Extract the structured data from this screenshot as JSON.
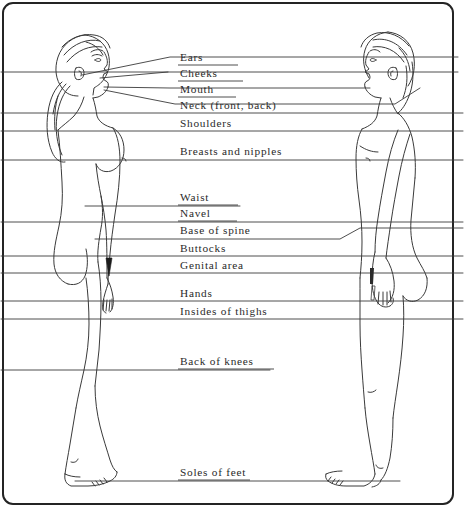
{
  "diagram": {
    "figures": [
      {
        "name": "female-side-profile",
        "side": "left",
        "facing": "right"
      },
      {
        "name": "male-side-profile",
        "side": "right",
        "facing": "left"
      }
    ],
    "labels": [
      {
        "id": "ears",
        "text": "Ears",
        "x": 180,
        "y": 60
      },
      {
        "id": "cheeks",
        "text": "Cheeks",
        "x": 180,
        "y": 76
      },
      {
        "id": "mouth",
        "text": "Mouth",
        "x": 180,
        "y": 92
      },
      {
        "id": "neck",
        "text": "Neck  (front,  back)",
        "x": 180,
        "y": 108
      },
      {
        "id": "shoulders",
        "text": "Shoulders",
        "x": 180,
        "y": 124
      },
      {
        "id": "breasts",
        "text": "Breasts and nipples",
        "x": 180,
        "y": 152
      },
      {
        "id": "waist",
        "text": "Waist",
        "x": 180,
        "y": 200
      },
      {
        "id": "navel",
        "text": "Navel",
        "x": 180,
        "y": 216
      },
      {
        "id": "base-of-spine",
        "text": "Base of spine",
        "x": 180,
        "y": 232
      },
      {
        "id": "buttocks",
        "text": "Buttocks",
        "x": 180,
        "y": 250
      },
      {
        "id": "genital-area",
        "text": "Genital area",
        "x": 180,
        "y": 267
      },
      {
        "id": "hands",
        "text": "Hands",
        "x": 180,
        "y": 295
      },
      {
        "id": "insides-of-thighs",
        "text": "Insides of thighs",
        "x": 180,
        "y": 312
      },
      {
        "id": "back-of-knees",
        "text": "Back of knees",
        "x": 180,
        "y": 363
      },
      {
        "id": "soles-of-feet",
        "text": "Soles of feet",
        "x": 180,
        "y": 473
      }
    ],
    "colors": {
      "ink": "#2a2a2a",
      "frame": "#242424",
      "paper": "#ffffff",
      "line": "#3a3a3a"
    }
  }
}
